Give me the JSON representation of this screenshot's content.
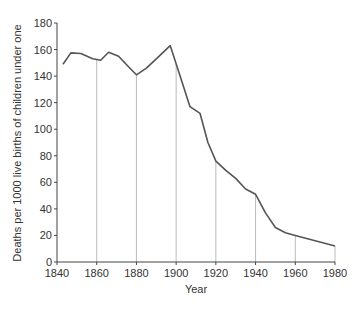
{
  "chart_data": {
    "type": "line",
    "title": "",
    "xlabel": "Year",
    "ylabel": "Deaths per 1000 live births of children under one",
    "xlim": [
      1840,
      1980
    ],
    "ylim": [
      0,
      180
    ],
    "x_ticks": [
      "1840",
      "1860",
      "1880",
      "1900",
      "1920",
      "1940",
      "1960",
      "1980"
    ],
    "y_ticks": [
      "0",
      "20",
      "40",
      "60",
      "80",
      "100",
      "120",
      "140",
      "160",
      "180"
    ],
    "grid": "vertical drop-lines from x-axis to curve at each 20-year tick",
    "legend": "none",
    "series": [
      {
        "name": "Infant mortality",
        "x": [
          1843,
          1847,
          1852,
          1858,
          1862,
          1866,
          1871,
          1876,
          1880,
          1885,
          1890,
          1897,
          1902,
          1907,
          1912,
          1916,
          1920,
          1925,
          1930,
          1935,
          1940,
          1945,
          1950,
          1955,
          1960,
          1980
        ],
        "y": [
          149,
          157.5,
          157,
          153,
          152,
          158,
          155,
          147,
          141,
          146,
          153,
          163,
          140,
          117,
          112,
          90,
          76,
          69,
          63,
          55,
          51,
          37,
          26,
          22,
          20,
          12
        ]
      }
    ],
    "colors": {
      "line": "#555555",
      "axis": "#444444",
      "grid": "#bbbbbb"
    }
  }
}
